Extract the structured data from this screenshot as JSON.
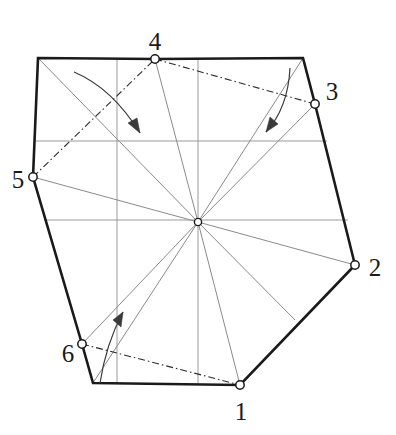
{
  "figure": {
    "width": 396,
    "height": 435,
    "background_color": "#ffffff"
  },
  "style": {
    "outline_color": "#1a1a1a",
    "outline_width": 2.6,
    "thin_line_color": "#8a8a8a",
    "thin_line_width": 1.0,
    "grid_color": "#9a9a9a",
    "grid_width": 1.0,
    "chord_color": "#2b2b2b",
    "chord_width": 1.1,
    "chord_dash_pattern": "7 3 1.5 3",
    "arrow_color": "#3a3a3a",
    "arrow_width": 1.2,
    "marker_stroke": "#1a1a1a",
    "marker_fill": "#ffffff",
    "marker_radius": 4.2,
    "label_color": "#1a1a1a",
    "label_font_size": 25
  },
  "center": {
    "name": "centroid",
    "x": 198,
    "y": 222,
    "marker_radius": 3.6
  },
  "outline": {
    "name": "polygon-outline",
    "closed": true,
    "points": [
      {
        "id": "corner-top-left",
        "x": 38,
        "y": 58,
        "numbered": false
      },
      {
        "id": "vertex-4",
        "x": 155,
        "y": 59,
        "numbered": true
      },
      {
        "id": "corner-top-right",
        "x": 303,
        "y": 58,
        "numbered": false
      },
      {
        "id": "vertex-3",
        "x": 315,
        "y": 104,
        "numbered": true
      },
      {
        "id": "vertex-2",
        "x": 355,
        "y": 265,
        "numbered": true
      },
      {
        "id": "vertex-1",
        "x": 240,
        "y": 385,
        "numbered": true
      },
      {
        "id": "corner-bottom-left",
        "x": 93,
        "y": 383,
        "numbered": false
      },
      {
        "id": "vertex-6",
        "x": 82,
        "y": 344,
        "numbered": true
      },
      {
        "id": "vertex-5",
        "x": 33,
        "y": 177,
        "numbered": true
      }
    ]
  },
  "vertices": [
    {
      "label": "1",
      "point_x": 240,
      "point_y": 385,
      "label_x": 241,
      "label_y": 411
    },
    {
      "label": "2",
      "point_x": 355,
      "point_y": 265,
      "label_x": 375,
      "label_y": 267
    },
    {
      "label": "3",
      "point_x": 315,
      "point_y": 104,
      "label_x": 332,
      "label_y": 91
    },
    {
      "label": "4",
      "point_x": 155,
      "point_y": 59,
      "label_x": 155,
      "label_y": 41
    },
    {
      "label": "5",
      "point_x": 33,
      "point_y": 177,
      "label_x": 18,
      "label_y": 179
    },
    {
      "label": "6",
      "point_x": 82,
      "point_y": 344,
      "label_x": 68,
      "label_y": 353
    }
  ],
  "radial_lines": {
    "name": "center-cevians",
    "from": {
      "x": 198,
      "y": 222
    },
    "to": [
      {
        "id": "ray-to-vertex-1",
        "x": 240,
        "y": 385
      },
      {
        "id": "ray-to-vertex-2",
        "x": 355,
        "y": 265
      },
      {
        "id": "ray-to-vertex-3",
        "x": 315,
        "y": 104
      },
      {
        "id": "ray-to-vertex-4",
        "x": 155,
        "y": 59
      },
      {
        "id": "ray-to-vertex-5",
        "x": 33,
        "y": 177
      },
      {
        "id": "ray-to-vertex-6",
        "x": 82,
        "y": 344
      },
      {
        "id": "ray-to-corner-top-left",
        "x": 38,
        "y": 58
      },
      {
        "id": "ray-to-corner-top-right",
        "x": 303,
        "y": 58
      },
      {
        "id": "ray-to-corner-bottom-left",
        "x": 93,
        "y": 383
      },
      {
        "id": "ray-to-lower-right-edge",
        "x": 295,
        "y": 320
      }
    ]
  },
  "grid_lines": {
    "name": "construction-grid",
    "vertical": [
      {
        "id": "grid-v-left",
        "x": 117,
        "y_top": 58,
        "y_bottom": 383
      },
      {
        "id": "grid-v-mid",
        "x": 198,
        "y_top": 58,
        "y_bottom": 384
      }
    ],
    "horizontal": [
      {
        "id": "grid-h-upper",
        "y": 141,
        "x_left": 35,
        "x_right": 327
      },
      {
        "id": "grid-h-lower",
        "y": 220,
        "x_left": 44,
        "x_right": 348
      }
    ]
  },
  "chords": [
    {
      "id": "chord-5-4",
      "from_label": "5",
      "to_label": "4",
      "x1": 33,
      "y1": 177,
      "x2": 155,
      "y2": 59
    },
    {
      "id": "chord-4-3",
      "from_label": "4",
      "to_label": "3",
      "x1": 155,
      "y1": 59,
      "x2": 315,
      "y2": 104
    },
    {
      "id": "chord-6-1",
      "from_label": "6",
      "to_label": "1",
      "x1": 82,
      "y1": 344,
      "x2": 240,
      "y2": 385
    }
  ],
  "arrows": [
    {
      "id": "arrow-top-left",
      "direction": "down-right",
      "path": "M 74 72 Q 112 88 140 133",
      "head": "M 140 133 L 128 123 L 137 118 Z"
    },
    {
      "id": "arrow-top-right",
      "direction": "down-left",
      "path": "M 290 68 Q 288 108 266 132",
      "head": "M 266 132 L 270 117 L 278 124 Z"
    },
    {
      "id": "arrow-bottom-left",
      "direction": "up-right",
      "path": "M 100 383 Q 106 344 123 312",
      "head": "M 123 312 L 121 327 L 113 320 Z"
    }
  ]
}
